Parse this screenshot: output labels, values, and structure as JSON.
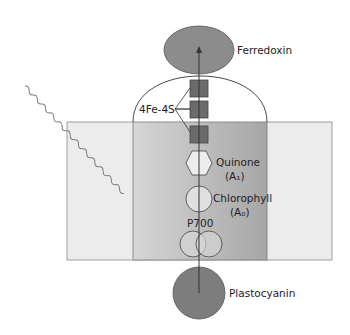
{
  "diagram": {
    "colors": {
      "membrane_outer": "#ececec",
      "membrane_inner_left": "#d4d4d4",
      "membrane_inner_right": "#a9a9a9",
      "protein_dark": "#7a7a7a",
      "cluster_fill": "#6a6a6a",
      "cofactor_fill": "#e2e2e2",
      "line": "#3a3a3a",
      "photon": "#777777"
    },
    "components": [
      {
        "id": "ferredoxin",
        "label": "Ferredoxin",
        "shape": "ellipse"
      },
      {
        "id": "fe-s",
        "label": "4Fe-4S",
        "shape": "squares",
        "count": 3
      },
      {
        "id": "quinone",
        "label": "Quinone",
        "sublabel": "(A₁)",
        "shape": "hexagon"
      },
      {
        "id": "chlorophyll",
        "label": "Chlorophyll",
        "sublabel": "(A₀)",
        "shape": "circle"
      },
      {
        "id": "p700",
        "label": "P700",
        "shape": "double-circle"
      },
      {
        "id": "plastocyanin",
        "label": "Plastocyanin",
        "shape": "circle"
      }
    ],
    "labels": {
      "ferredoxin": "Ferredoxin",
      "fes": "4Fe-4S",
      "quinone": "Quinone",
      "quinone_sub": "(A₁)",
      "chlorophyll": "Chlorophyll",
      "chlorophyll_sub": "(A₀)",
      "p700": "P700",
      "plastocyanin": "Plastocyanin"
    },
    "electron_path": "Plastocyanin → P700 → Chlorophyll (A₀) → Quinone (A₁) → 4Fe-4S → Ferredoxin",
    "light_input": "photon (wavy line) striking P700"
  }
}
